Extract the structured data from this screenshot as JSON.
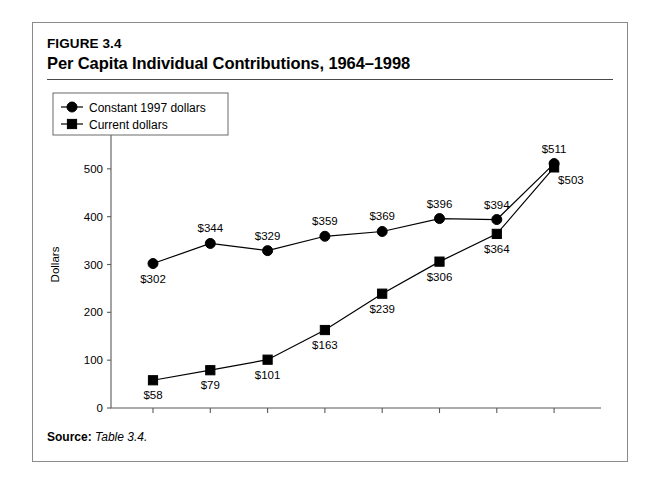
{
  "figure": {
    "number": "FIGURE 3.4",
    "title": "Per Capita Individual Contributions, 1964–1998",
    "source_label": "Source:",
    "source_value": "Table 3.4."
  },
  "chart_data": {
    "type": "line",
    "title": "Per Capita Individual Contributions, 1964–1998",
    "xlabel": "Year",
    "ylabel": "Dollars",
    "categories": [
      "1964",
      "1969",
      "1974",
      "1979",
      "1984",
      "1989",
      "1994",
      "1998"
    ],
    "x": [
      1964,
      1969,
      1974,
      1979,
      1984,
      1989,
      1994,
      1998
    ],
    "xlim": [
      1962,
      1999.5
    ],
    "ylim": [
      0,
      600
    ],
    "ytick_labels": [
      "0",
      "100",
      "200",
      "300",
      "400",
      "500",
      "600"
    ],
    "yticks": [
      0,
      100,
      200,
      300,
      400,
      500,
      600
    ],
    "grid": false,
    "legend_position": "top-left",
    "series": [
      {
        "name": "Constant 1997 dollars",
        "marker": "circle",
        "values": [
          302,
          344,
          329,
          359,
          369,
          396,
          394,
          511
        ],
        "data_labels": [
          "$302",
          "$344",
          "$329",
          "$359",
          "$369",
          "$396",
          "$394",
          "$511"
        ],
        "label_positions": [
          "below",
          "above",
          "above",
          "above",
          "above",
          "above",
          "above",
          "above"
        ]
      },
      {
        "name": "Current dollars",
        "marker": "square",
        "values": [
          58,
          79,
          101,
          163,
          239,
          306,
          364,
          503
        ],
        "data_labels": [
          "$58",
          "$79",
          "$101",
          "$163",
          "$239",
          "$306",
          "$364",
          "$503"
        ],
        "label_positions": [
          "below",
          "below",
          "below",
          "below",
          "below",
          "below",
          "below",
          "right-below"
        ]
      }
    ]
  },
  "colors": {
    "ink": "#000000",
    "axis": "#5a5a5a",
    "frame": "#8b8b8b",
    "rule": "#4a4a4a"
  }
}
